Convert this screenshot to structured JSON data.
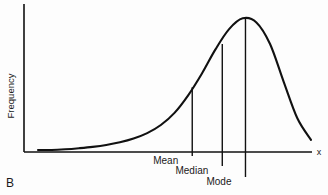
{
  "figure": {
    "panel_label": "B",
    "background_color": "#fdfdfd",
    "line_color": "#111111"
  },
  "chart_data": {
    "type": "line",
    "title": "",
    "subtitle": "",
    "xlabel": "x",
    "ylabel": "Frequency",
    "grid": false,
    "legend": null,
    "axis": {
      "x_tick_labels": [],
      "y_tick_labels": [],
      "xlim": [
        0,
        1
      ],
      "ylim": [
        0,
        1
      ],
      "show_arrow_heads": false
    },
    "curve": {
      "name": "frequency-distribution",
      "x": [
        0.05,
        0.1,
        0.15,
        0.2,
        0.25,
        0.3,
        0.35,
        0.4,
        0.45,
        0.5,
        0.55,
        0.6,
        0.65,
        0.7,
        0.75,
        0.8,
        0.85,
        0.9,
        0.95,
        1.0
      ],
      "y": [
        0.015,
        0.02,
        0.028,
        0.038,
        0.052,
        0.072,
        0.1,
        0.14,
        0.2,
        0.29,
        0.42,
        0.58,
        0.76,
        0.91,
        0.99,
        0.96,
        0.8,
        0.52,
        0.25,
        0.09
      ]
    },
    "markers": [
      {
        "name": "mean",
        "label": "Mean",
        "x": 0.565,
        "y_top": 0.48
      },
      {
        "name": "median",
        "label": "Median",
        "x": 0.675,
        "y_top": 0.8
      },
      {
        "name": "mode",
        "label": "Mode",
        "x": 0.76,
        "y_top": 0.995
      }
    ]
  }
}
